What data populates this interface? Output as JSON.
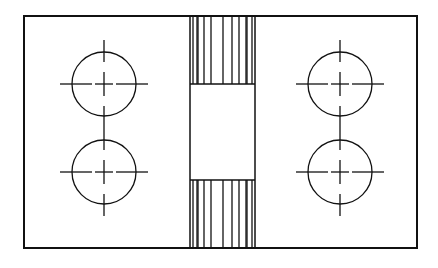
{
  "diagram": {
    "title": "",
    "type": "mechanical-drawing",
    "colors": {
      "line": "#111111",
      "background": "#ffffff"
    },
    "outer_frame": {
      "x": 24,
      "y": 16,
      "w": 393,
      "h": 232
    },
    "center_column": {
      "x1": 190,
      "x2": 255,
      "window_top": 84,
      "window_bottom": 180
    },
    "hatch_lines_x": [
      193,
      197,
      198,
      204,
      211,
      223,
      232,
      239,
      246,
      247,
      252
    ],
    "holes": [
      {
        "id": "left-upper",
        "cx": 104,
        "cy": 84,
        "r": 32
      },
      {
        "id": "left-lower",
        "cx": 104,
        "cy": 172,
        "r": 32
      },
      {
        "id": "right-upper",
        "cx": 340,
        "cy": 84,
        "r": 32
      },
      {
        "id": "right-lower",
        "cx": 340,
        "cy": 172,
        "r": 32
      }
    ]
  }
}
